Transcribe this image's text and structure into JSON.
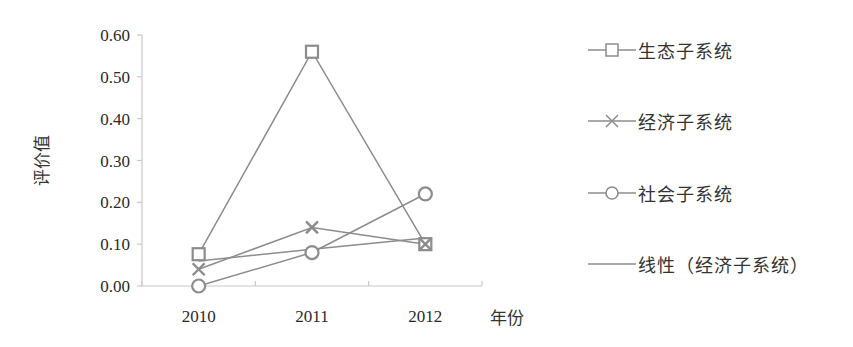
{
  "chart_data": {
    "type": "line",
    "title": "",
    "xlabel": "年份",
    "ylabel": "评价值",
    "categories": [
      "2010",
      "2011",
      "2012"
    ],
    "yticks": [
      "0.00",
      "0.10",
      "0.20",
      "0.30",
      "0.40",
      "0.50",
      "0.60"
    ],
    "ylim": [
      0,
      0.6
    ],
    "grid": false,
    "legend_position": "right",
    "series": [
      {
        "name": "生态子系统",
        "marker": "square",
        "values": [
          0.076,
          0.56,
          0.1
        ]
      },
      {
        "name": "经济子系统",
        "marker": "x",
        "values": [
          0.04,
          0.14,
          0.1
        ]
      },
      {
        "name": "社会子系统",
        "marker": "circle",
        "values": [
          0.0,
          0.08,
          0.22
        ]
      },
      {
        "name": "线性（经济子系统）",
        "marker": "none",
        "trendline_of": "经济子系统",
        "values": [
          0.06,
          0.088,
          0.115
        ]
      }
    ]
  },
  "colors": {
    "series_line": "#8c8c8c",
    "axis": "#c8c8c8",
    "text": "#2a2a2a"
  },
  "legend": {
    "items": [
      {
        "label": "生态子系统",
        "icon": "square-marker-icon"
      },
      {
        "label": "经济子系统",
        "icon": "x-marker-icon"
      },
      {
        "label": "社会子系统",
        "icon": "circle-marker-icon"
      },
      {
        "label": "线性（经济子系统）",
        "icon": "line-icon"
      }
    ]
  }
}
